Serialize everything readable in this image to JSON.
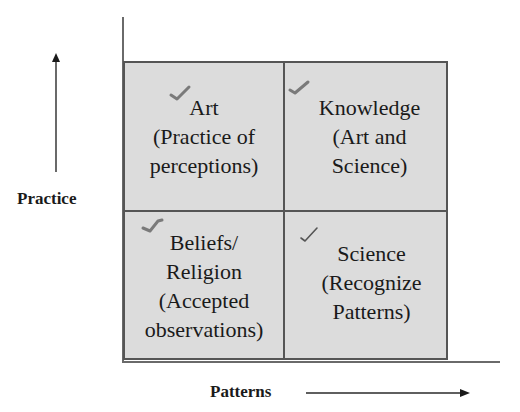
{
  "diagram": {
    "y_axis": {
      "label": "Practice",
      "direction": "up"
    },
    "x_axis": {
      "label": "Patterns",
      "direction": "right"
    },
    "quadrants": [
      {
        "position": "top-left",
        "text": "Art\n(Practice of\nperceptions)",
        "check_icon": "checkmark-icon"
      },
      {
        "position": "top-right",
        "text": "Knowledge\n(Art and\nScience)",
        "check_icon": "checkmark-icon"
      },
      {
        "position": "bottom-left",
        "text": "Beliefs/\nReligion\n(Accepted\nobservations)",
        "check_icon": "checkmark-icon"
      },
      {
        "position": "bottom-right",
        "text": "Science\n(Recognize\nPatterns)",
        "check_icon": "checkmark-icon"
      }
    ],
    "colors": {
      "fill": "#dcdcdc",
      "border": "#555555",
      "axis": "#6a6a6a",
      "text": "#1a1a1a",
      "check": "#777777"
    }
  }
}
